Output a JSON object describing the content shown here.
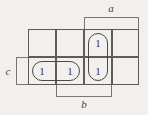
{
  "diagram": {
    "type": "karnaugh-map",
    "background_color": "#f2f0ec",
    "line_color": "#5d5c5a",
    "text_color": "#3a3937"
  },
  "grid": {
    "columns": 4,
    "rows": 2,
    "cells": [
      {
        "row": 0,
        "col": 0,
        "value": ""
      },
      {
        "row": 0,
        "col": 1,
        "value": ""
      },
      {
        "row": 0,
        "col": 2,
        "value": "1"
      },
      {
        "row": 0,
        "col": 3,
        "value": ""
      },
      {
        "row": 1,
        "col": 0,
        "value": "1"
      },
      {
        "row": 1,
        "col": 1,
        "value": "1"
      },
      {
        "row": 1,
        "col": 2,
        "value": "1"
      },
      {
        "row": 1,
        "col": 3,
        "value": ""
      }
    ]
  },
  "groups": [
    {
      "name": "vertical-group-column-3",
      "orientation": "vertical",
      "cells": "r0c2,r1c2"
    },
    {
      "name": "horizontal-group-row-2",
      "orientation": "horizontal",
      "cells": "r1c0,r1c1"
    }
  ],
  "labels": {
    "a": "a",
    "b": "b",
    "c": "c"
  },
  "brackets": [
    {
      "name": "a",
      "side": "top",
      "spans": "columns 3-4"
    },
    {
      "name": "b",
      "side": "bottom",
      "spans": "columns 2-3"
    },
    {
      "name": "c",
      "side": "left",
      "spans": "row 2"
    }
  ]
}
